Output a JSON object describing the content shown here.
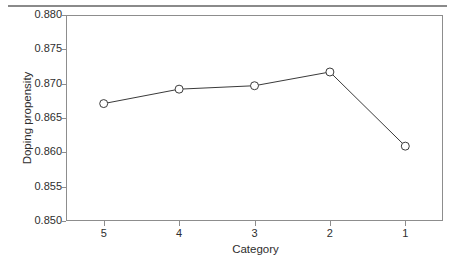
{
  "figure": {
    "has_top_rule": true,
    "background_color": "#ffffff",
    "frame_color": "#8d8d8d",
    "line_color": "#3a3a3a",
    "marker_face_color": "#ffffff"
  },
  "chart_data": {
    "type": "line",
    "title": "",
    "xlabel": "Category",
    "ylabel": "Doping propensity",
    "categories": [
      "5",
      "4",
      "3",
      "2",
      "1"
    ],
    "values": [
      0.8671,
      0.8692,
      0.8697,
      0.8717,
      0.8609
    ],
    "series": [
      {
        "name": "Doping propensity",
        "values": [
          0.8671,
          0.8692,
          0.8697,
          0.8717,
          0.8609
        ]
      }
    ],
    "ylim": [
      0.85,
      0.88
    ],
    "yticks": [
      "0.850",
      "0.855",
      "0.860",
      "0.865",
      "0.870",
      "0.875",
      "0.880"
    ],
    "ytick_values": [
      0.85,
      0.855,
      0.86,
      0.865,
      0.87,
      0.875,
      0.88
    ],
    "xticks": [
      "5",
      "4",
      "3",
      "2",
      "1"
    ],
    "grid": false,
    "legend": "none",
    "marker": "open-circle"
  }
}
